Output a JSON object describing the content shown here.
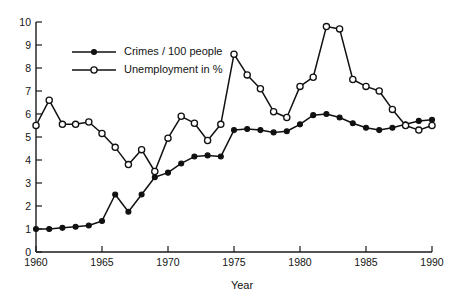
{
  "chart_data": {
    "type": "line",
    "title": "",
    "subtitle": "",
    "xlabel": "Year",
    "ylabel": "",
    "xlim": [
      1960,
      1990
    ],
    "ylim": [
      0,
      10
    ],
    "grid": false,
    "legend_position": "top-left-inside",
    "x_tick_labels": [
      "1960",
      "1965",
      "1970",
      "1975",
      "1980",
      "1985",
      "1990"
    ],
    "x_ticks": [
      1960,
      1965,
      1970,
      1975,
      1980,
      1985,
      1990
    ],
    "y_tick_labels": [
      "0",
      "1",
      "2",
      "3",
      "4",
      "5",
      "6",
      "7",
      "8",
      "9",
      "10"
    ],
    "y_ticks": [
      0,
      1,
      2,
      3,
      4,
      5,
      6,
      7,
      8,
      9,
      10
    ],
    "x": [
      1960,
      1961,
      1962,
      1963,
      1964,
      1965,
      1966,
      1967,
      1968,
      1969,
      1970,
      1971,
      1972,
      1973,
      1974,
      1975,
      1976,
      1977,
      1978,
      1979,
      1980,
      1981,
      1982,
      1983,
      1984,
      1985,
      1986,
      1987,
      1988,
      1989,
      1990
    ],
    "series": [
      {
        "name": "Crimes / 100 people",
        "marker": "filled-circle",
        "color": "#111111",
        "values": [
          1.0,
          1.0,
          1.05,
          1.1,
          1.15,
          1.35,
          2.5,
          1.75,
          2.5,
          3.25,
          3.45,
          3.85,
          4.15,
          4.2,
          4.15,
          5.3,
          5.35,
          5.3,
          5.2,
          5.25,
          5.55,
          5.95,
          6.0,
          5.85,
          5.6,
          5.4,
          5.3,
          5.4,
          5.55,
          5.7,
          5.75
        ]
      },
      {
        "name": "Unemployment in %",
        "marker": "open-circle",
        "color": "#111111",
        "values": [
          5.5,
          6.6,
          5.55,
          5.55,
          5.65,
          5.15,
          4.55,
          3.8,
          4.45,
          3.5,
          4.95,
          5.9,
          5.6,
          4.85,
          5.55,
          8.6,
          7.7,
          7.1,
          6.1,
          5.85,
          7.2,
          7.6,
          9.8,
          9.7,
          7.5,
          7.2,
          7.0,
          6.2,
          5.5,
          5.3,
          5.5
        ]
      }
    ]
  },
  "legend": {
    "entries": [
      {
        "label": "Crimes / 100 people"
      },
      {
        "label": "Unemployment in %"
      }
    ]
  },
  "axes": {
    "x_title": "Year"
  }
}
